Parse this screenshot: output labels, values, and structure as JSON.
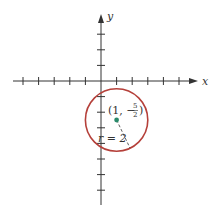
{
  "figure": {
    "axes": {
      "x_label": "x",
      "y_label": "y",
      "origin_px": [
        101,
        81
      ],
      "unit_px": 15.6,
      "x_ticks": [
        -5,
        -4,
        -3,
        -2,
        -1,
        1,
        2,
        3,
        4,
        5
      ],
      "y_ticks": [
        4,
        3,
        2,
        1,
        -1,
        -2,
        -3,
        -4,
        -5,
        -6,
        -7,
        -8
      ]
    },
    "circle": {
      "center": [
        1,
        -2.5
      ],
      "radius": 2,
      "stroke_color": "#b5403a"
    },
    "center_point": {
      "label_prefix": "(1, −",
      "label_num": "5",
      "label_den": "2",
      "label_suffix": ")",
      "color": "#2a8a6a"
    },
    "radius_label": "r = 2"
  }
}
